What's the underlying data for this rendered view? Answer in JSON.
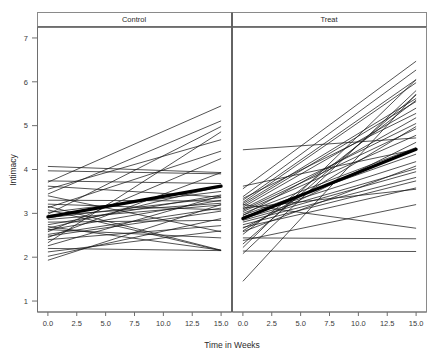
{
  "chart_data": {
    "type": "line",
    "title": "",
    "xlabel": "Time in Weeks",
    "ylabel": "Intimacy",
    "xlim": [
      -0.9,
      15.9
    ],
    "ylim": [
      0.75,
      7.25
    ],
    "xticks": [
      0.0,
      2.5,
      5.0,
      7.5,
      10.0,
      12.5,
      15.0
    ],
    "xtick_labels": [
      "0.0",
      "2.5",
      "5.0",
      "7.5",
      "10.0",
      "12.5",
      "15.0"
    ],
    "yticks": [
      1,
      2,
      3,
      4,
      5,
      6,
      7
    ],
    "ytick_labels": [
      "1",
      "2",
      "3",
      "4",
      "5",
      "6",
      "7"
    ],
    "grid": false,
    "legend_position": "none",
    "panel_layout": "1x2",
    "x_endpoints": [
      0.0,
      15.0
    ],
    "panels": [
      {
        "label": "Control",
        "mean_line": {
          "name": "group-mean",
          "x": [
            0.0,
            15.0
          ],
          "values": [
            2.92,
            3.62
          ]
        },
        "series": [
          {
            "name": "s1",
            "values": [
              4.07,
              3.93
            ]
          },
          {
            "name": "s2",
            "values": [
              3.97,
              3.9
            ]
          },
          {
            "name": "s3",
            "values": [
              3.74,
              3.68
            ]
          },
          {
            "name": "s4",
            "values": [
              3.71,
              5.45
            ]
          },
          {
            "name": "s5",
            "values": [
              3.62,
              3.37
            ]
          },
          {
            "name": "s6",
            "values": [
              3.55,
              4.68
            ]
          },
          {
            "name": "s7",
            "values": [
              3.44,
              5.11
            ]
          },
          {
            "name": "s8",
            "values": [
              3.4,
              2.58
            ]
          },
          {
            "name": "s9",
            "values": [
              3.3,
              3.28
            ]
          },
          {
            "name": "s10",
            "values": [
              3.21,
              3.08
            ]
          },
          {
            "name": "s11",
            "values": [
              3.13,
              4.42
            ]
          },
          {
            "name": "s12",
            "values": [
              3.08,
              2.15
            ]
          },
          {
            "name": "s13",
            "values": [
              3.02,
              3.5
            ]
          },
          {
            "name": "s14",
            "values": [
              2.98,
              4.98
            ]
          },
          {
            "name": "s15",
            "values": [
              2.95,
              3.23
            ]
          },
          {
            "name": "s16",
            "values": [
              2.9,
              3.36
            ]
          },
          {
            "name": "s17",
            "values": [
              2.86,
              3.19
            ]
          },
          {
            "name": "s18",
            "values": [
              2.8,
              2.84
            ]
          },
          {
            "name": "s19",
            "values": [
              2.74,
              3.42
            ]
          },
          {
            "name": "s20",
            "values": [
              2.7,
              2.16
            ]
          },
          {
            "name": "s21",
            "values": [
              2.66,
              3.62
            ]
          },
          {
            "name": "s22",
            "values": [
              2.62,
              3.3
            ]
          },
          {
            "name": "s23",
            "values": [
              2.58,
              4.25
            ]
          },
          {
            "name": "s24",
            "values": [
              2.52,
              3.12
            ]
          },
          {
            "name": "s25",
            "values": [
              2.45,
              3.93
            ]
          },
          {
            "name": "s26",
            "values": [
              2.4,
              2.72
            ]
          },
          {
            "name": "s27",
            "values": [
              2.33,
              4.86
            ]
          },
          {
            "name": "s28",
            "values": [
              2.26,
              3.4
            ]
          },
          {
            "name": "s29",
            "values": [
              2.2,
              2.15
            ]
          },
          {
            "name": "s30",
            "values": [
              2.12,
              2.6
            ]
          },
          {
            "name": "s31",
            "values": [
              2.02,
              2.88
            ]
          },
          {
            "name": "s32",
            "values": [
              1.93,
              3.2
            ]
          },
          {
            "name": "s33",
            "values": [
              2.48,
              3.05
            ]
          },
          {
            "name": "s34",
            "values": [
              2.63,
              2.44
            ]
          },
          {
            "name": "s35",
            "values": [
              3.16,
              2.16
            ]
          }
        ]
      },
      {
        "label": "Treat",
        "mean_line": {
          "name": "group-mean",
          "x": [
            0.0,
            15.0
          ],
          "values": [
            2.88,
            4.46
          ]
        },
        "series": [
          {
            "name": "t1",
            "values": [
              4.45,
              4.72
            ]
          },
          {
            "name": "t2",
            "values": [
              3.56,
              6.47
            ]
          },
          {
            "name": "t3",
            "values": [
              3.38,
              6.27
            ]
          },
          {
            "name": "t4",
            "values": [
              3.3,
              6.05
            ]
          },
          {
            "name": "t5",
            "values": [
              3.25,
              5.98
            ]
          },
          {
            "name": "t6",
            "values": [
              3.22,
              5.62
            ]
          },
          {
            "name": "t7",
            "values": [
              3.18,
              5.55
            ]
          },
          {
            "name": "t8",
            "values": [
              3.14,
              5.4
            ]
          },
          {
            "name": "t9",
            "values": [
              3.1,
              5.05
            ]
          },
          {
            "name": "t10",
            "values": [
              3.07,
              4.93
            ]
          },
          {
            "name": "t11",
            "values": [
              3.04,
              4.78
            ]
          },
          {
            "name": "t12",
            "values": [
              3.0,
              4.5
            ]
          },
          {
            "name": "t13",
            "values": [
              2.96,
              4.35
            ]
          },
          {
            "name": "t14",
            "values": [
              2.92,
              4.18
            ]
          },
          {
            "name": "t15",
            "values": [
              2.88,
              4.02
            ]
          },
          {
            "name": "t16",
            "values": [
              2.84,
              3.95
            ]
          },
          {
            "name": "t17",
            "values": [
              2.8,
              3.82
            ]
          },
          {
            "name": "t18",
            "values": [
              2.74,
              3.74
            ]
          },
          {
            "name": "t19",
            "values": [
              2.68,
              3.58
            ]
          },
          {
            "name": "t20",
            "values": [
              2.6,
              4.98
            ]
          },
          {
            "name": "t21",
            "values": [
              2.52,
              5.58
            ]
          },
          {
            "name": "t22",
            "values": [
              2.44,
              2.42
            ]
          },
          {
            "name": "t23",
            "values": [
              2.38,
              3.2
            ]
          },
          {
            "name": "t24",
            "values": [
              2.3,
              5.7
            ]
          },
          {
            "name": "t25",
            "values": [
              2.22,
              6.05
            ]
          },
          {
            "name": "t26",
            "values": [
              2.14,
              2.13
            ]
          },
          {
            "name": "t27",
            "values": [
              2.08,
              5.8
            ]
          },
          {
            "name": "t28",
            "values": [
              1.45,
              5.72
            ]
          },
          {
            "name": "t29",
            "values": [
              3.2,
              2.66
            ]
          },
          {
            "name": "t30",
            "values": [
              3.62,
              4.46
            ]
          },
          {
            "name": "t31",
            "values": [
              2.95,
              5.18
            ]
          },
          {
            "name": "t32",
            "values": [
              2.66,
              4.62
            ]
          },
          {
            "name": "t33",
            "values": [
              3.12,
              3.55
            ]
          },
          {
            "name": "t34",
            "values": [
              2.58,
              4.08
            ]
          },
          {
            "name": "t35",
            "values": [
              3.34,
              5.28
            ]
          }
        ]
      }
    ]
  }
}
